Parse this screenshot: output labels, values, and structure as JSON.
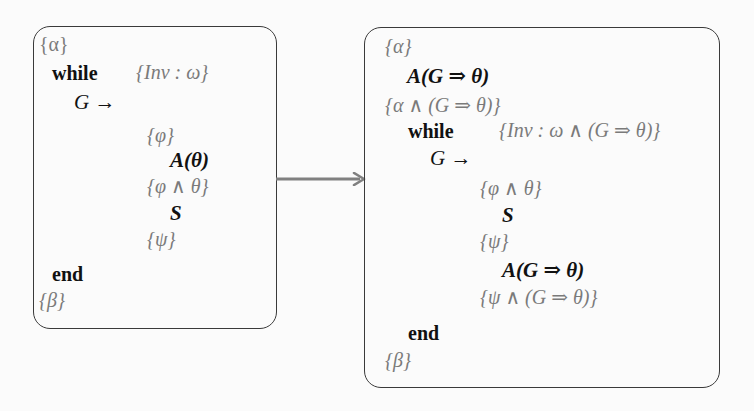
{
  "diagram": {
    "colors": {
      "background": "#fbfbfb",
      "box_border": "#3a3a3a",
      "assertion_text": "#7a7a7a",
      "statement_text": "#111111",
      "arrow": "#808080"
    },
    "left_box": {
      "lines": [
        {
          "kind": "assertion",
          "text": "{α}"
        },
        {
          "kind": "keyword",
          "text": "while"
        },
        {
          "kind": "invariant",
          "text": "{Inv : ω}"
        },
        {
          "kind": "guard",
          "text": "G →"
        },
        {
          "kind": "assertion",
          "text": "{φ}"
        },
        {
          "kind": "statement",
          "text": "A(θ)"
        },
        {
          "kind": "assertion",
          "text": "{φ ∧ θ}"
        },
        {
          "kind": "statement",
          "text": "S"
        },
        {
          "kind": "assertion",
          "text": "{ψ}"
        },
        {
          "kind": "keyword",
          "text": "end"
        },
        {
          "kind": "assertion",
          "text": "{β}"
        }
      ]
    },
    "arrow": {
      "direction": "left-to-right",
      "icon": "right-arrow-icon"
    },
    "right_box": {
      "lines": [
        {
          "kind": "assertion",
          "text": "{α}"
        },
        {
          "kind": "statement",
          "text": "A(G ⇒ θ)"
        },
        {
          "kind": "assertion",
          "text": "{α ∧ (G ⇒ θ)}"
        },
        {
          "kind": "keyword",
          "text": "while"
        },
        {
          "kind": "invariant",
          "text": "{Inv : ω ∧ (G ⇒ θ)}"
        },
        {
          "kind": "guard",
          "text": "G →"
        },
        {
          "kind": "assertion",
          "text": "{φ ∧ θ}"
        },
        {
          "kind": "statement",
          "text": "S"
        },
        {
          "kind": "assertion",
          "text": "{ψ}"
        },
        {
          "kind": "statement",
          "text": "A(G ⇒ θ)"
        },
        {
          "kind": "assertion",
          "text": "{ψ ∧ (G ⇒ θ)}"
        },
        {
          "kind": "keyword",
          "text": "end"
        },
        {
          "kind": "assertion",
          "text": "{β}"
        }
      ]
    }
  }
}
